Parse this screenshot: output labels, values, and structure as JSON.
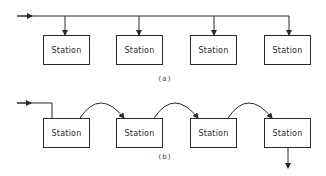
{
  "diagram_a": {
    "label": "(a)",
    "stations": [
      "Station",
      "Station",
      "Station",
      "Station"
    ],
    "topology": "bus"
  },
  "diagram_b": {
    "label": "(b)",
    "stations": [
      "Station",
      "Station",
      "Station",
      "Station"
    ],
    "topology": "ring/daisy-chain"
  },
  "colors": {
    "line": "#2a2a2a",
    "background": "#ffffff"
  }
}
